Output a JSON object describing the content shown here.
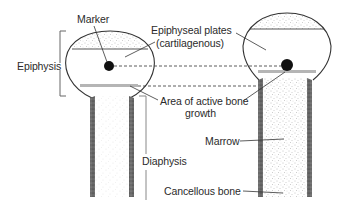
{
  "figure": {
    "type": "diagram"
  },
  "labels": {
    "marker": "Marker",
    "epiphyseal_plates_line1": "Epiphyseal plates",
    "epiphyseal_plates_line2": "(cartilagenous)",
    "epiphysis": "Epiphysis",
    "active_growth_line1": "Area of active bone",
    "active_growth_line2": "growth",
    "diaphysis": "Diaphysis",
    "marrow": "Marrow",
    "cancellous_bone": "Cancellous bone"
  },
  "bones": [
    {
      "name": "younger-bone",
      "position": "left",
      "description": "Shorter bone with marker in epiphysis"
    },
    {
      "name": "older-bone",
      "position": "right",
      "description": "Longer bone; marker stays same distance from epiphysis while bone lengthens"
    }
  ],
  "colors": {
    "outline": "#333333",
    "stipple": "#9a9a9a",
    "cortex": "#555555",
    "growth_band": "#b5b5b5",
    "marker": "#111111",
    "bracket": "#666666",
    "text": "#2b2b2b"
  }
}
